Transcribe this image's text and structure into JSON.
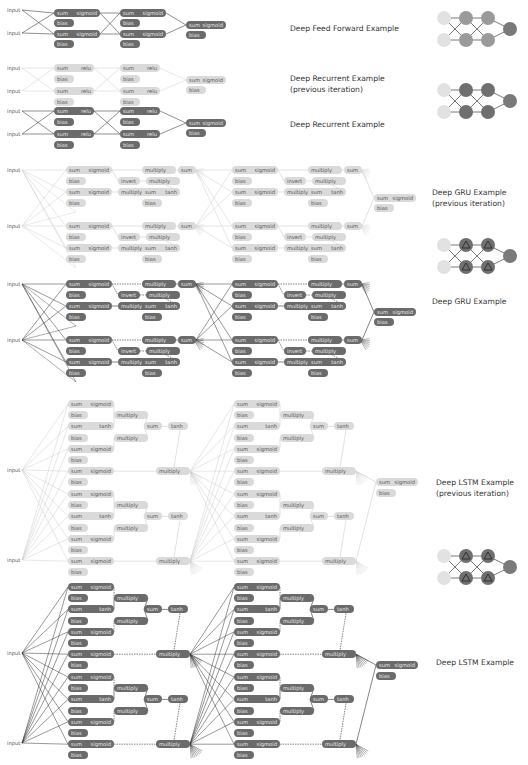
{
  "sections": [
    {
      "id": "ff",
      "title": "Deep Feed Forward Example",
      "title_lines": [
        "Deep Feed Forward Example"
      ],
      "label_x": 290,
      "label_y": 24,
      "icon": {
        "x": 436,
        "y": 10,
        "type": "plain"
      }
    },
    {
      "id": "rnn_prev",
      "title": "Deep Recurrent Example (previous iteration)",
      "title_lines": [
        "Deep Recurrent Example",
        "(previous iteration)"
      ],
      "label_x": 290,
      "label_y": 74
    },
    {
      "id": "rnn",
      "title": "Deep Recurrent Example",
      "title_lines": [
        "Deep Recurrent Example"
      ],
      "label_x": 290,
      "label_y": 120,
      "icon": {
        "x": 436,
        "y": 82,
        "type": "recurrent"
      }
    },
    {
      "id": "gru_prev",
      "title": "Deep GRU Example (previous iteration)",
      "title_lines": [
        "Deep GRU Example",
        "(previous iteration)"
      ],
      "label_x": 432,
      "label_y": 188
    },
    {
      "id": "gru",
      "title": "Deep GRU Example",
      "title_lines": [
        "Deep GRU Example"
      ],
      "label_x": 432,
      "label_y": 297,
      "icon": {
        "x": 436,
        "y": 237,
        "type": "gated"
      }
    },
    {
      "id": "lstm_prev",
      "title": "Deep LSTM Example (previous iteration)",
      "title_lines": [
        "Deep LSTM Example",
        "(previous iteration)"
      ],
      "label_x": 436,
      "label_y": 478
    },
    {
      "id": "lstm",
      "title": "Deep LSTM Example",
      "title_lines": [
        "Deep LSTM Example"
      ],
      "label_x": 436,
      "label_y": 658,
      "icon": {
        "x": 436,
        "y": 548,
        "type": "gated"
      }
    }
  ],
  "node_labels": {
    "input": "input",
    "sum": "sum",
    "sigmoid": "sigmoid",
    "relu": "relu",
    "tanh": "tanh",
    "bias": "bias",
    "multiply": "multiply",
    "invert": "invert"
  },
  "colors": {
    "dark_node": "#6b6b6b",
    "light_node": "#dadada",
    "edge_dark": "#333333",
    "edge_light": "#cfcfcf",
    "icon_input": "#e2e2e2",
    "icon_hidden": "#6f6f6f",
    "icon_output": "#7a7a7a"
  }
}
